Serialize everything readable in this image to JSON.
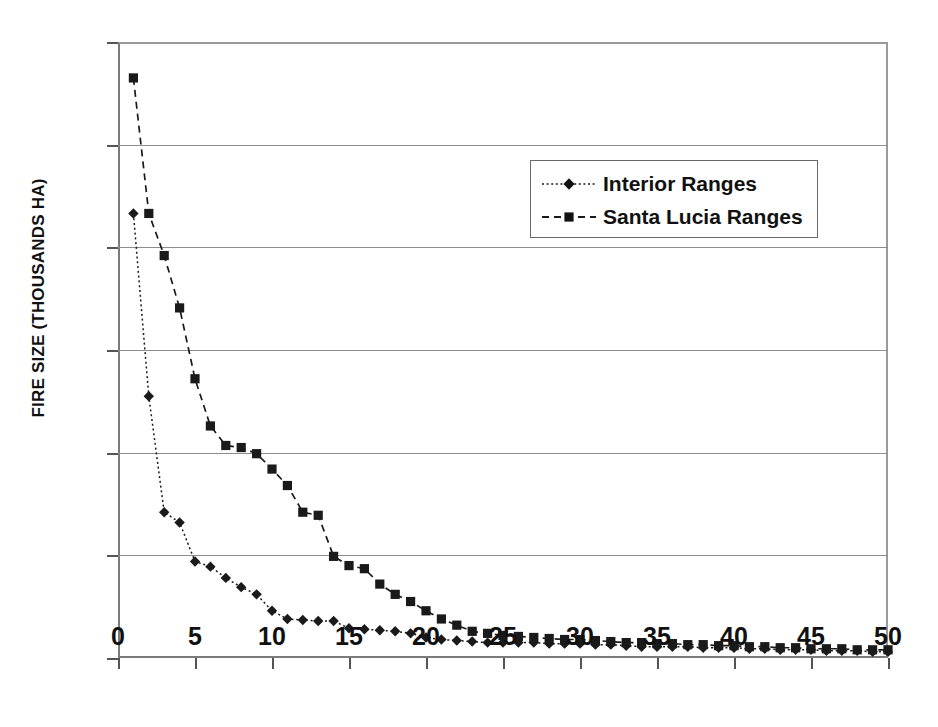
{
  "chart_data": {
    "type": "line",
    "title": "",
    "xlabel": "",
    "ylabel": "FIRE SIZE (THOUSANDS HA)",
    "xlim": [
      0,
      50
    ],
    "ylim": [
      0,
      60
    ],
    "xticks": [
      0,
      5,
      10,
      15,
      20,
      25,
      30,
      35,
      40,
      45,
      50
    ],
    "yticks": [
      0,
      10,
      20,
      30,
      40,
      50,
      60
    ],
    "grid": "horizontal",
    "legend_position": "upper-center-right",
    "x": [
      1,
      2,
      3,
      4,
      5,
      6,
      7,
      8,
      9,
      10,
      11,
      12,
      13,
      14,
      15,
      16,
      17,
      18,
      19,
      20,
      21,
      22,
      23,
      24,
      25,
      26,
      27,
      28,
      29,
      30,
      31,
      32,
      33,
      34,
      35,
      36,
      37,
      38,
      39,
      40,
      41,
      42,
      43,
      44,
      45,
      46,
      47,
      48,
      49,
      50
    ],
    "series": [
      {
        "name": "Interior Ranges",
        "marker": "diamond",
        "line_style": "dotted",
        "color": "#1a1a1a",
        "values": [
          43.3,
          25.5,
          14.2,
          13.2,
          9.4,
          8.9,
          7.8,
          6.9,
          6.2,
          4.6,
          3.8,
          3.7,
          3.6,
          3.6,
          2.9,
          2.8,
          2.7,
          2.6,
          2.4,
          2.0,
          1.8,
          1.7,
          1.6,
          1.5,
          1.5,
          1.5,
          1.5,
          1.4,
          1.4,
          1.4,
          1.3,
          1.3,
          1.2,
          1.1,
          1.1,
          1.1,
          1.1,
          1.0,
          1.0,
          1.0,
          0.9,
          0.9,
          0.8,
          0.8,
          0.8,
          0.7,
          0.7,
          0.7,
          0.6,
          0.6
        ]
      },
      {
        "name": "Santa Lucia Ranges",
        "marker": "square",
        "line_style": "dashed",
        "color": "#1a1a1a",
        "values": [
          56.5,
          43.3,
          39.2,
          34.1,
          27.2,
          22.6,
          20.7,
          20.5,
          19.9,
          18.4,
          16.8,
          14.2,
          13.9,
          9.9,
          9.0,
          8.7,
          7.2,
          6.2,
          5.5,
          4.6,
          3.8,
          3.2,
          2.6,
          2.4,
          2.2,
          2.1,
          2.0,
          1.9,
          1.8,
          1.8,
          1.7,
          1.6,
          1.5,
          1.5,
          1.4,
          1.4,
          1.3,
          1.3,
          1.2,
          1.2,
          1.1,
          1.1,
          1.0,
          1.0,
          0.9,
          0.9,
          0.9,
          0.8,
          0.8,
          0.8
        ]
      }
    ]
  },
  "legend": {
    "items": [
      {
        "label": "Interior Ranges"
      },
      {
        "label": "Santa Lucia Ranges"
      }
    ]
  }
}
